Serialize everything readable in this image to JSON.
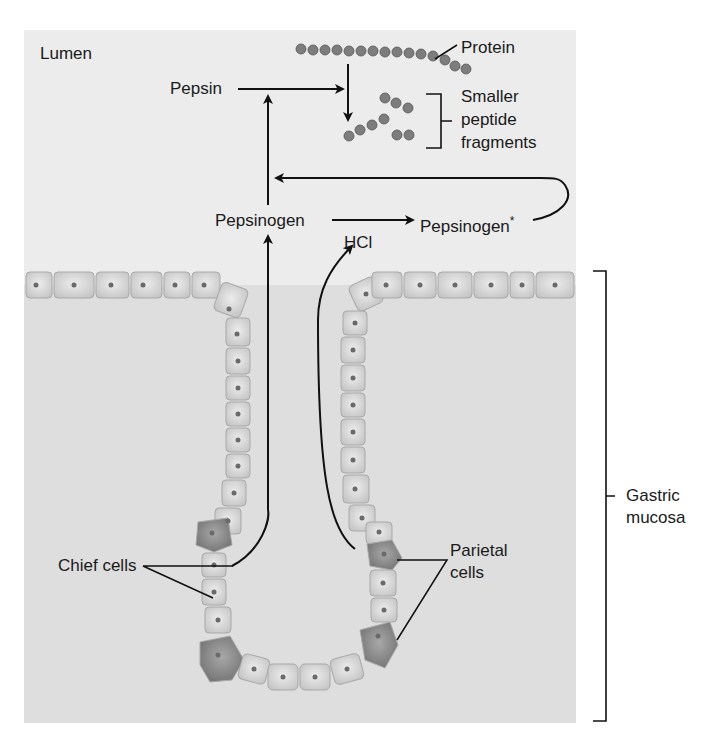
{
  "figure": {
    "regions": {
      "lumen": "Lumen",
      "gastric_mucosa_line1": "Gastric",
      "gastric_mucosa_line2": "mucosa"
    },
    "molecules": {
      "protein": "Protein",
      "fragments_line1": "Smaller",
      "fragments_line2": "peptide",
      "fragments_line3": "fragments",
      "pepsin": "Pepsin",
      "pepsinogen": "Pepsinogen",
      "pepsinogen_active": "Pepsinogen",
      "asterisk": "*",
      "hcl": "HCl"
    },
    "cells": {
      "chief": "Chief cells",
      "parietal_line1": "Parietal",
      "parietal_line2": "cells"
    },
    "colors": {
      "lumen_bg": "#ececec",
      "mucosa_bg": "#dedede",
      "cell_fill": "#d3d3d3",
      "parietal_fill": "#8c8c8c",
      "bead": "#7d7d7d",
      "arrow": "#111111"
    }
  }
}
